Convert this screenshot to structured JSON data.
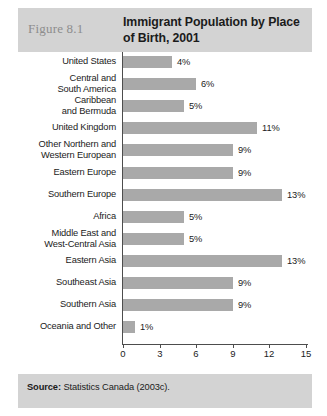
{
  "figure": {
    "number": "Figure 8.1",
    "title": "Immigrant Population by Place of Birth, 2001",
    "source_label": "Source:",
    "source_text": "Statistics Canada (2003c)."
  },
  "colors": {
    "band": "#d3d3d3",
    "bar": "#a9a9a9",
    "axis": "#4d4d4d",
    "text": "#1b1b1b",
    "fig_number": "#8d8d8d"
  },
  "chart_data": {
    "type": "bar",
    "orientation": "horizontal",
    "title": "Immigrant Population by Place of Birth, 2001",
    "xlabel": "",
    "ylabel": "",
    "xlim": [
      0,
      15
    ],
    "xticks": [
      0,
      3,
      6,
      9,
      12,
      15
    ],
    "grid": false,
    "legend": false,
    "value_suffix": "%",
    "categories": [
      "United States",
      "Central and\nSouth America",
      "Caribbean\nand Bermuda",
      "United Kingdom",
      "Other Northern and\nWestern European",
      "Eastern Europe",
      "Southern Europe",
      "Africa",
      "Middle East and\nWest-Central Asia",
      "Eastern Asia",
      "Southeast Asia",
      "Southern Asia",
      "Oceania and Other"
    ],
    "values": [
      4,
      6,
      5,
      11,
      9,
      9,
      13,
      5,
      5,
      13,
      9,
      9,
      1
    ],
    "labels": [
      "4%",
      "6%",
      "5%",
      "11%",
      "9%",
      "9%",
      "13%",
      "5%",
      "5%",
      "13%",
      "9%",
      "9%",
      "1%"
    ]
  }
}
